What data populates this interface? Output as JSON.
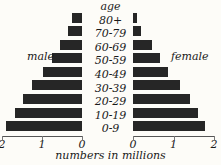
{
  "chart_data": {
    "type": "bar",
    "subtype": "population-pyramid",
    "title": "",
    "xlabel": "numbers in millions",
    "ylabel": "age",
    "categories": [
      "80+",
      "70-79",
      "60-69",
      "50-59",
      "40-49",
      "30-39",
      "20-29",
      "10-19",
      "0-9"
    ],
    "series": [
      {
        "name": "male",
        "values": [
          0.25,
          0.35,
          0.55,
          0.75,
          0.97,
          1.25,
          1.45,
          1.65,
          1.88
        ]
      },
      {
        "name": "female",
        "values": [
          0.1,
          0.2,
          0.48,
          0.66,
          0.86,
          1.17,
          1.4,
          1.6,
          1.78
        ]
      }
    ],
    "xlim_left": [
      2,
      0
    ],
    "xlim_right": [
      0,
      2
    ],
    "left_ticks": [
      "2",
      "1",
      "0"
    ],
    "right_ticks": [
      "0",
      "1",
      "2"
    ],
    "left_tick_values": [
      2,
      1,
      0
    ],
    "right_tick_values": [
      0,
      1,
      2
    ],
    "grid": false,
    "legend": "inline-side-labels",
    "bar_color": "#262626",
    "axis_color": "#555555",
    "text_color": "#1a1a1a",
    "background_color": "#fdfcf8"
  },
  "labels": {
    "age_header": "age",
    "male": "male",
    "female": "female",
    "caption": "numbers in millions"
  },
  "age_groups": [
    {
      "label": "80+",
      "male": 0.25,
      "female": 0.1
    },
    {
      "label": "70-79",
      "male": 0.35,
      "female": 0.2
    },
    {
      "label": "60-69",
      "male": 0.55,
      "female": 0.48
    },
    {
      "label": "50-59",
      "male": 0.75,
      "female": 0.66
    },
    {
      "label": "40-49",
      "male": 0.97,
      "female": 0.86
    },
    {
      "label": "30-39",
      "male": 1.25,
      "female": 1.17
    },
    {
      "label": "20-29",
      "male": 1.45,
      "female": 1.4
    },
    {
      "label": "10-19",
      "male": 1.65,
      "female": 1.6
    },
    {
      "label": "0-9",
      "male": 1.88,
      "female": 1.78
    }
  ],
  "axis": {
    "left_ticks": [
      {
        "label": "2"
      },
      {
        "label": "1"
      },
      {
        "label": "0"
      }
    ],
    "right_ticks": [
      {
        "label": "0"
      },
      {
        "label": "1"
      },
      {
        "label": "2"
      }
    ]
  }
}
